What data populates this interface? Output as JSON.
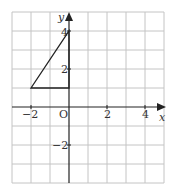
{
  "diagram": {
    "type": "coordinate-grid",
    "grid": {
      "x_min": -3,
      "x_max": 5,
      "y_min": -4,
      "y_max": 5,
      "unit_px": 19,
      "origin_px": [
        69,
        107
      ]
    },
    "axes": {
      "x_label": "x",
      "y_label": "y",
      "origin_label": "O"
    },
    "x_ticks": [
      {
        "value": -2,
        "label": "−2"
      },
      {
        "value": 2,
        "label": "2"
      },
      {
        "value": 4,
        "label": "4"
      }
    ],
    "y_ticks": [
      {
        "value": 4,
        "label": "4"
      },
      {
        "value": 2,
        "label": "2"
      },
      {
        "value": -2,
        "label": "−2"
      }
    ],
    "shape": {
      "name": "triangle",
      "vertices": [
        [
          -2,
          1
        ],
        [
          0,
          1
        ],
        [
          0,
          4
        ]
      ]
    },
    "colors": {
      "grid": "#bdbdbd",
      "axis": "#222222",
      "shape": "#222222"
    }
  }
}
